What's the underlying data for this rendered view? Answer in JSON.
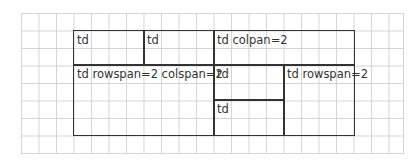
{
  "diagram": {
    "cells": [
      {
        "label": "td"
      },
      {
        "label": "td"
      },
      {
        "label": "td colpan=2"
      },
      {
        "label": "td rowspan=2 colspan=2"
      },
      {
        "label": "td"
      },
      {
        "label": "td rowspan=2"
      },
      {
        "label": "td"
      }
    ]
  }
}
